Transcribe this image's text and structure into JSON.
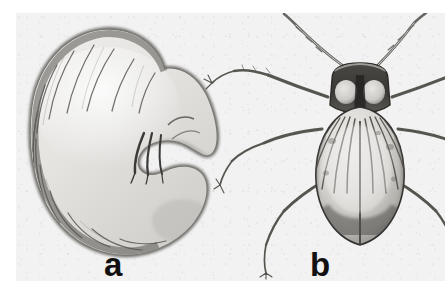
{
  "figure": {
    "kind": "scientific-plate",
    "medium": "black-and-white halftone photograph",
    "background_color": "#f2f2f2",
    "page_color": "#ffffff",
    "ink_color": "#2b2b2b",
    "panels": [
      {
        "id": "a",
        "label": "a",
        "subject": "scarab beetle larva",
        "common_name": "white grub",
        "view": "lateral, C-shaped curled posture",
        "features": [
          "segmented abdomen with transverse intersegmental creases",
          "darkened dorsal margin along outer curve",
          "three pairs of thoracic legs at anterior end",
          "rounded swollen posterior end (raster)",
          "pale cream body with grey tonal shading"
        ],
        "segment_count": 13
      },
      {
        "id": "b",
        "label": "b",
        "subject": "adult beetle",
        "view": "dorsal",
        "features": [
          "dark transverse pronotum with two pale rounded patches",
          "broad oval elytra with longitudinal striae",
          "median sutural line dividing the elytra",
          "small triangular scutellum below the pronotum",
          "two long multi-segmented antennae spread in a V",
          "three pairs of slender jointed legs with tarsi"
        ],
        "leg_pairs": 3,
        "antenna_count": 2
      }
    ]
  },
  "labels": {
    "panel_a": "a",
    "panel_b": "b"
  }
}
